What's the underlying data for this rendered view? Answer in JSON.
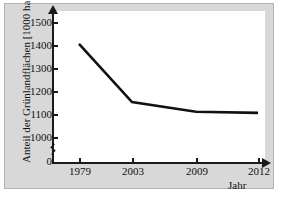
{
  "chart_data": {
    "type": "line",
    "title": "",
    "xlabel": "Jahr",
    "ylabel": "Anteil der Grünlandflächen [1000 ha]",
    "categories": [
      "1979",
      "2003",
      "2009",
      "2012"
    ],
    "values": [
      1405,
      1152,
      1110,
      1105
    ],
    "series": [
      {
        "name": "Grünlandfläche",
        "values": [
          1405,
          1152,
          1110,
          1105
        ]
      }
    ],
    "x_tick_labels": [
      "1979",
      "2003",
      "2009",
      "2012"
    ],
    "y_tick_labels": [
      "0",
      "1000",
      "1100",
      "1200",
      "1300",
      "1400",
      "1500"
    ],
    "ylim": [
      1000,
      1500
    ],
    "y_axis_break": true,
    "y_axis_break_symbol": "zigzag",
    "grid": false,
    "legend": false,
    "line_color": "#111111",
    "plot_background": "#ffffff",
    "figure_background": "#d8d8d8"
  },
  "axis": {
    "y_title": "Anteil der Grünlandflächen [1000 ha]",
    "x_title": "Jahr",
    "y_ticks": [
      {
        "label": "1500",
        "value": 1500
      },
      {
        "label": "1400",
        "value": 1400
      },
      {
        "label": "1300",
        "value": 1300
      },
      {
        "label": "1200",
        "value": 1200
      },
      {
        "label": "1100",
        "value": 1100
      },
      {
        "label": "1000",
        "value": 1000
      },
      {
        "label": "0",
        "value": 0
      }
    ],
    "x_ticks": [
      {
        "label": "1979"
      },
      {
        "label": "2003"
      },
      {
        "label": "2009"
      },
      {
        "label": "2012"
      }
    ]
  }
}
